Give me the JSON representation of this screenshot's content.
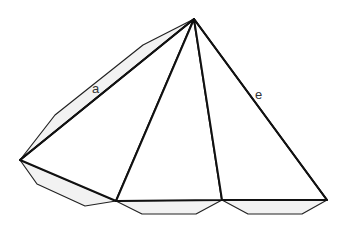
{
  "diagram": {
    "type": "pyramid-net-with-glue-flaps",
    "colors": {
      "background": "#ffffff",
      "edge": "#111111",
      "flap_fill": "#f2f2f2"
    },
    "labels": {
      "a": "a",
      "e": "e"
    },
    "vertices": {
      "apex": [
        194,
        19
      ],
      "left": [
        20,
        160
      ],
      "base1": [
        116,
        201
      ],
      "base2": [
        222,
        200
      ],
      "right": [
        327,
        200
      ]
    }
  }
}
